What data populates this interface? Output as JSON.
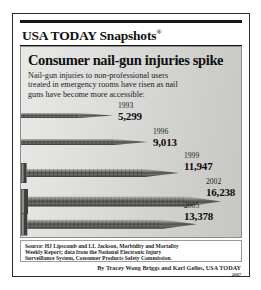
{
  "masthead": {
    "title": "USA TODAY Snapshots",
    "registered_mark": "®"
  },
  "headline": "Consumer nail-gun injuries spike",
  "subhead_lines": [
    "Nail-gun injuries to non-professional users",
    "treated in emergency rooms have risen as nail",
    "guns have become more accessible:"
  ],
  "chart_data": {
    "type": "bar",
    "title": "Consumer nail-gun injuries spike",
    "subtitle": "Nail-gun injuries to non-professional users treated in emergency rooms have risen as nail guns have become more accessible:",
    "xlabel": "",
    "ylabel": "Injuries treated in emergency rooms",
    "categories": [
      "1993",
      "1996",
      "1999",
      "2002",
      "2005"
    ],
    "values": [
      5299,
      9013,
      11947,
      16238,
      13378
    ],
    "value_labels": [
      "5,299",
      "9,013",
      "11,947",
      "16,238",
      "13,378"
    ],
    "ylim": [
      0,
      16238
    ],
    "grid": false,
    "legend": null,
    "orientation": "horizontal",
    "note": "Bars are drawn as pictorial nails whose length encodes the value."
  },
  "rows": [
    {
      "year": "1993",
      "value": "5,299",
      "nail_length": 92,
      "head": false,
      "thickness": 5,
      "row_top": 0,
      "label_left": 97
    },
    {
      "year": "1996",
      "value": "9,013",
      "nail_length": 127,
      "head": false,
      "thickness": 6,
      "row_top": 26,
      "label_left": 132
    },
    {
      "year": "1999",
      "value": "11,947",
      "nail_length": 158,
      "head": true,
      "thickness": 8,
      "row_top": 50,
      "label_left": 163
    },
    {
      "year": "2002",
      "value": "16,238",
      "nail_length": 200,
      "head": true,
      "thickness": 10,
      "row_top": 76,
      "label_left": 185
    },
    {
      "year": "2005",
      "value": "13,378",
      "nail_length": 176,
      "head": true,
      "thickness": 9,
      "row_top": 100,
      "label_left": 163
    }
  ],
  "source_lines": [
    "Source: HJ Lipscomb and LL Jackson, Morbidity and Mortality",
    "Weekly Report; data from the National Electronic Injury",
    "Surveillance System, Consumer Products Safety Commission."
  ],
  "byline": {
    "credit": "By Tracey Wong Briggs and Karl Gelles, USA TODAY",
    "year": "2007"
  },
  "colors": {
    "ink": "#111111",
    "panel_light": "#e9e9e7",
    "panel_dark": "#c6c6c3",
    "border": "#2b2b2b",
    "nail_metal": "#6f6f6c"
  }
}
